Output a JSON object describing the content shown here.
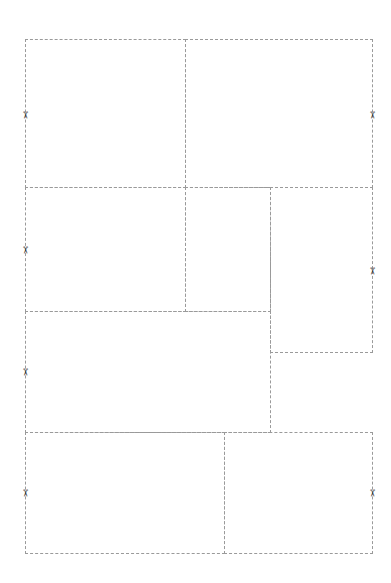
{
  "sheet": {
    "panels": [
      {
        "id": "p1",
        "x": 25,
        "y": 39,
        "w": 161,
        "h": 149
      },
      {
        "id": "p2",
        "x": 185,
        "y": 39,
        "w": 188,
        "h": 149
      },
      {
        "id": "p3",
        "x": 25,
        "y": 187,
        "w": 161,
        "h": 125
      },
      {
        "id": "p4",
        "x": 185,
        "y": 187,
        "w": 86,
        "h": 125
      },
      {
        "id": "p5",
        "x": 270,
        "y": 187,
        "w": 103,
        "h": 166
      },
      {
        "id": "p6",
        "x": 25,
        "y": 311,
        "w": 246,
        "h": 122
      },
      {
        "id": "p7",
        "x": 25,
        "y": 432,
        "w": 200,
        "h": 122
      },
      {
        "id": "p8",
        "x": 224,
        "y": 432,
        "w": 149,
        "h": 122
      }
    ],
    "scissors": [
      {
        "x": 20,
        "y": 110
      },
      {
        "x": 367,
        "y": 110
      },
      {
        "x": 20,
        "y": 245
      },
      {
        "x": 367,
        "y": 266
      },
      {
        "x": 20,
        "y": 367
      },
      {
        "x": 20,
        "y": 488
      },
      {
        "x": 367,
        "y": 488
      }
    ],
    "scissor_glyph": "✂"
  }
}
